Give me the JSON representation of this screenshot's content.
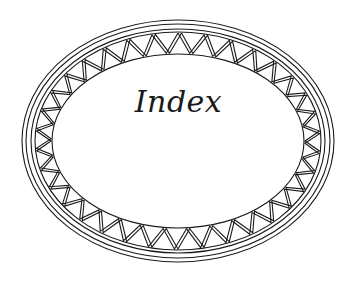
{
  "ornament": {
    "title": "Index",
    "center": {
      "x": 178,
      "y": 141
    },
    "rings": [
      {
        "rx": 156,
        "ry": 121
      },
      {
        "rx": 152,
        "ry": 117
      },
      {
        "rx": 147,
        "ry": 112
      },
      {
        "rx": 143,
        "ry": 109
      }
    ],
    "band": {
      "outer_rx": 143,
      "outer_ry": 109,
      "inner_rx": 126,
      "inner_ry": 87
    },
    "zigzag_count": 34,
    "stroke_color": "#1a1a1a",
    "background": "#ffffff"
  }
}
